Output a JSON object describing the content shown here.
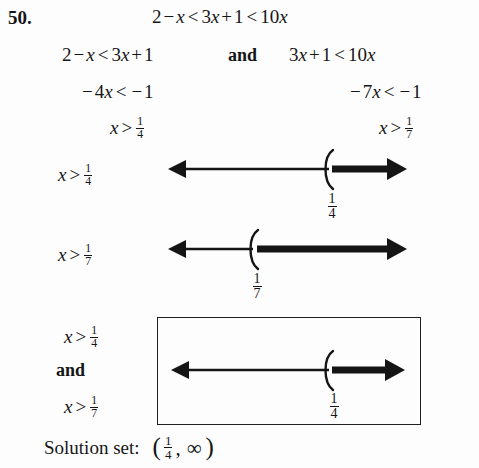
{
  "exercise": {
    "number": "50.",
    "original_inequality": {
      "lhs": "2 − x",
      "rel1": "<",
      "mid": "3x + 1",
      "rel2": "<",
      "rhs": "10x",
      "full_text": "2 − x < 3x + 1 < 10x"
    },
    "split_row": {
      "left": "2 − x < 3x + 1",
      "connector": "and",
      "right": "3x + 1 < 10x"
    },
    "step_row": {
      "left": "−4x < −1",
      "right": "−7x < −1"
    },
    "result_row": {
      "left": "x > 1/4",
      "left_numerator": "1",
      "left_denominator": "4",
      "right": "x > 1/7",
      "right_numerator": "1",
      "right_denominator": "7"
    }
  },
  "numberlines": [
    {
      "id": "numberline-quarter",
      "label": "x > 1/4",
      "label_numerator": "1",
      "label_denominator": "4",
      "tick_label_numerator": "1",
      "tick_label_denominator": "4",
      "boundary_symbol": "(",
      "boundary_included": false,
      "shaded_direction": "right",
      "boundary_fraction_position": 0.68
    },
    {
      "id": "numberline-seventh",
      "label": "x > 1/7",
      "label_numerator": "1",
      "label_denominator": "7",
      "tick_label_numerator": "1",
      "tick_label_denominator": "7",
      "boundary_symbol": "(",
      "boundary_included": false,
      "shaded_direction": "right",
      "boundary_fraction_position": 0.35
    }
  ],
  "intersection": {
    "label_top": "x > 1/4",
    "label_top_numerator": "1",
    "label_top_denominator": "4",
    "connector": "and",
    "label_bottom": "x > 1/7",
    "label_bottom_numerator": "1",
    "label_bottom_denominator": "7",
    "numberline": {
      "id": "numberline-intersection",
      "tick_label_numerator": "1",
      "tick_label_denominator": "4",
      "boundary_symbol": "(",
      "boundary_included": false,
      "shaded_direction": "right",
      "boundary_fraction_position": 0.68
    }
  },
  "solution": {
    "prefix": "Solution set:",
    "interval_open": "(",
    "interval_numerator": "1",
    "interval_denominator": "4",
    "interval_comma": ",",
    "interval_infinity": "∞",
    "interval_close": ")",
    "interval_text": "(1/4, ∞)"
  },
  "colors": {
    "ink": "#151515",
    "background": "#fdfdfd",
    "box_border": "#202020"
  }
}
